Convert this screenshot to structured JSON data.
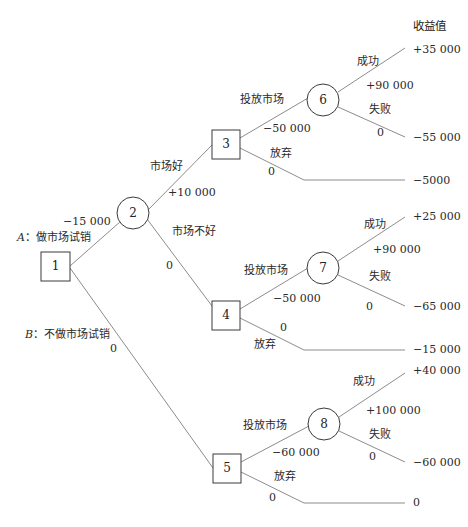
{
  "header": {
    "payoff_title": "收益值"
  },
  "nodes": [
    {
      "id": "1",
      "type": "decision"
    },
    {
      "id": "2",
      "type": "chance"
    },
    {
      "id": "3",
      "type": "decision"
    },
    {
      "id": "4",
      "type": "decision"
    },
    {
      "id": "5",
      "type": "decision"
    },
    {
      "id": "6",
      "type": "chance"
    },
    {
      "id": "7",
      "type": "chance"
    },
    {
      "id": "8",
      "type": "chance"
    }
  ],
  "branches": {
    "a": {
      "label": "A：做市场试销",
      "prefix": "A",
      "text": "：做市场试销",
      "value": "−15 000"
    },
    "b": {
      "prefix": "B",
      "text": "：不做市场试销",
      "value": "0"
    },
    "good": {
      "label": "市场好",
      "value": "+10 000"
    },
    "bad": {
      "label": "市场不好",
      "value": "0"
    },
    "n3_invest": {
      "label": "投放市场",
      "value": "−50 000"
    },
    "n3_abandon": {
      "label": "放弃",
      "value": "0"
    },
    "n4_invest": {
      "label": "投放市场",
      "value": "−50 000"
    },
    "n4_abandon": {
      "label": "放弃",
      "value": "0"
    },
    "n5_invest": {
      "label": "投放市场",
      "value": "−60 000"
    },
    "n5_abandon": {
      "label": "放弃",
      "value": "0"
    },
    "n6_success": {
      "label": "成功",
      "value": "+90 000"
    },
    "n6_fail": {
      "label": "失败",
      "value": "0"
    },
    "n7_success": {
      "label": "成功",
      "value": "+90 000"
    },
    "n7_fail": {
      "label": "失败",
      "value": "0"
    },
    "n8_success": {
      "label": "成功",
      "value": "+100 000"
    },
    "n8_fail": {
      "label": "失败",
      "value": "0"
    }
  },
  "payoffs": {
    "n6_success": "+35 000",
    "n6_fail": "−55 000",
    "n3_abandon": "−5000",
    "n7_success": "+25 000",
    "n7_fail": "−65 000",
    "n4_abandon": "−15 000",
    "n8_success": "+40 000",
    "n8_fail": "−60 000",
    "n5_abandon": "0"
  },
  "colors": {
    "line": "#8a8a8a",
    "node_stroke": "#3a3a3a",
    "text": "#222222"
  }
}
